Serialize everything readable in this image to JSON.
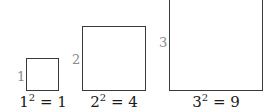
{
  "figure": {
    "squares": [
      {
        "side_label": "1",
        "base": "1",
        "exponent": "2",
        "equals": "=",
        "result": "1"
      },
      {
        "side_label": "2",
        "base": "2",
        "exponent": "2",
        "equals": "=",
        "result": "4"
      },
      {
        "side_label": "3",
        "base": "3",
        "exponent": "2",
        "equals": "=",
        "result": "9"
      }
    ],
    "colors": {
      "border": "#3a3a3a",
      "side_label": "#8a8a8a",
      "caption": "#1a1a1a"
    }
  }
}
